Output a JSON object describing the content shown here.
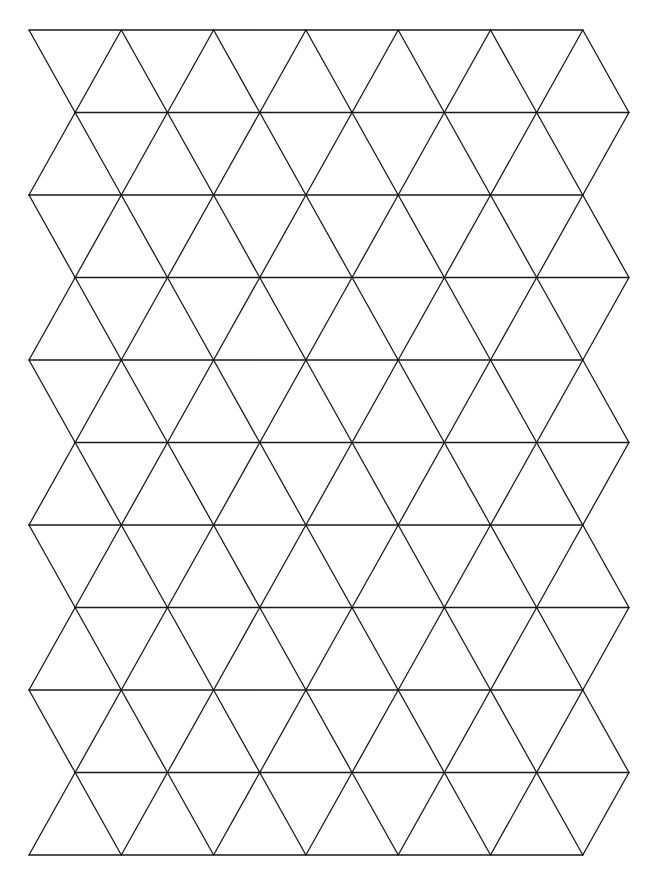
{
  "diagram": {
    "type": "isometric-triangle-grid",
    "stroke_color": "#1a1a1a",
    "background_color": "#ffffff",
    "stroke_width": 1.3,
    "origin_x": 29,
    "origin_y": 30,
    "column_spacing": 92.3,
    "row_spacing": 82.5,
    "rows": 10,
    "columns": 6,
    "row_left_offset_odd": 46.15
  }
}
